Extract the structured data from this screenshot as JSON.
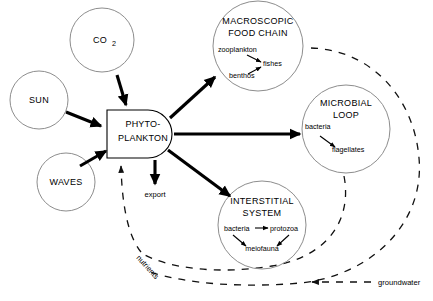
{
  "diagram": {
    "nodes": {
      "co2": {
        "label": "CO",
        "subscript": "2"
      },
      "sun": {
        "label": "SUN"
      },
      "waves": {
        "label": "WAVES"
      },
      "phytoplankton": {
        "line1": "PHYTO-",
        "line2": "PLANKTON"
      },
      "macroscopic": {
        "line1": "MACROSCOPIC",
        "line2": "FOOD CHAIN",
        "members": [
          "zooplankton",
          "benthos",
          "fishes"
        ]
      },
      "microbial": {
        "line1": "MICROBIAL",
        "line2": "LOOP",
        "members": [
          "bacteria",
          "flagellates"
        ]
      },
      "interstitial": {
        "line1": "INTERSTITIAL",
        "line2": "SYSTEM",
        "members": [
          "bacteria",
          "protozoa",
          "meiofauna"
        ]
      }
    },
    "flow_labels": {
      "export": "export",
      "nutrients": "nutrients",
      "groundwater": "groundwater"
    },
    "colors": {
      "background": "#ffffff",
      "stroke": "#000000",
      "circle_stroke": "#8d8d8d",
      "dashed_stroke": "#111111"
    }
  }
}
